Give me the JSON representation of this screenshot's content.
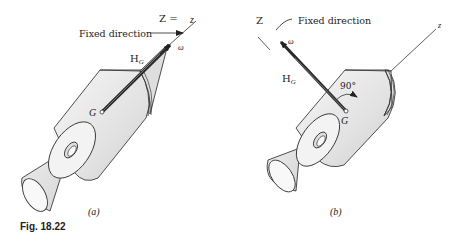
{
  "figure": {
    "caption": "Fig. 18.22",
    "colors": {
      "outline": "#3a3a3a",
      "body_fill": "#e4e4e4",
      "body_light": "#f2f2f2",
      "arrow": "#2b2b2b",
      "text": "#222222"
    }
  },
  "panel_a": {
    "label": "(a)",
    "axis_label_Z": "Z =",
    "axis_label_z": "z",
    "fixed_direction": "Fixed direction",
    "HG_main": "H",
    "HG_sub": "G",
    "omega": "ω",
    "G": "G"
  },
  "panel_b": {
    "label": "(b)",
    "axis_label_Z": "Z",
    "axis_label_z": "z",
    "fixed_direction": "Fixed direction",
    "HG_main": "H",
    "HG_sub": "G",
    "omega": "ω",
    "G": "G",
    "angle": "90°"
  }
}
